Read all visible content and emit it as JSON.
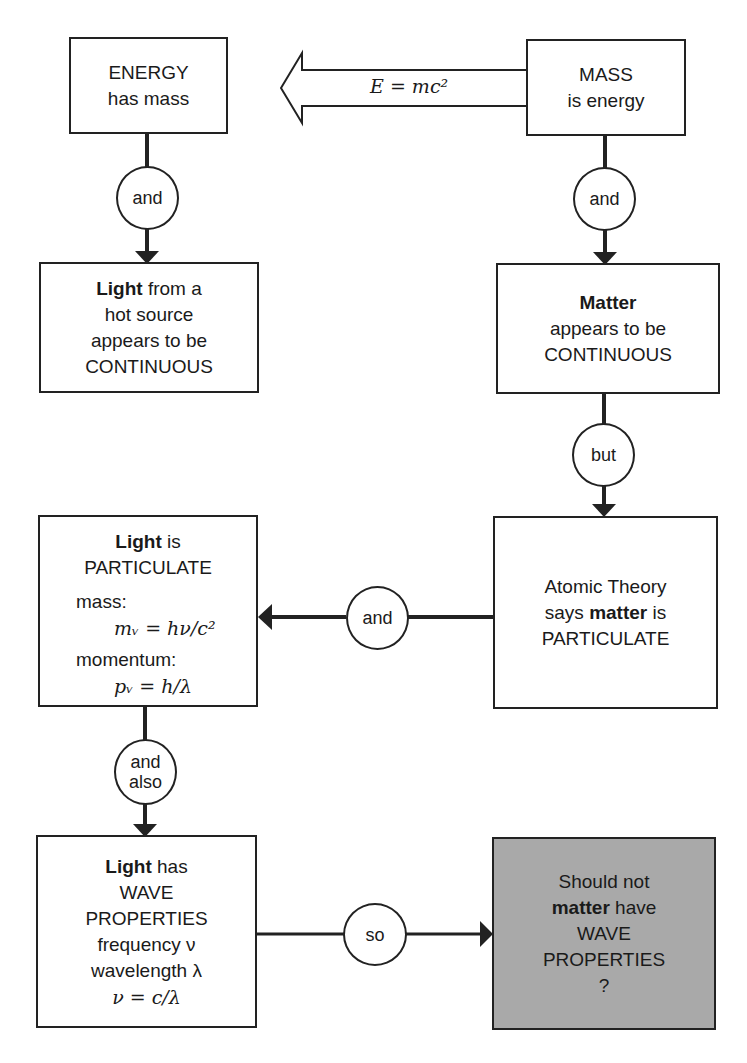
{
  "diagram": {
    "equivalence": {
      "label": "E = mc²"
    },
    "boxes": {
      "energy": {
        "line1": "ENERGY",
        "line2": "has mass"
      },
      "mass": {
        "line1": "MASS",
        "line2": "is energy"
      },
      "light_continuous": {
        "bold": "Light",
        "rest": " from a",
        "line2": "hot source",
        "line3": "appears to be",
        "line4": "CONTINUOUS"
      },
      "matter_continuous": {
        "bold": "Matter",
        "line2": "appears to be",
        "line3": "CONTINUOUS"
      },
      "light_particulate": {
        "bold": "Light",
        "rest": " is",
        "line2": "PARTICULATE",
        "mass_label": "mass:",
        "mass_eq": "mᵥ = hν/c²",
        "momentum_label": "momentum:",
        "momentum_eq": "pᵥ = h/λ"
      },
      "atomic_theory": {
        "line1": "Atomic Theory",
        "pre": "says ",
        "bold": "matter",
        "post": " is",
        "line3": "PARTICULATE"
      },
      "light_wave": {
        "bold": "Light",
        "rest": " has",
        "line2": "WAVE",
        "line3": "PROPERTIES",
        "line4": "frequency ν",
        "line5": "wavelength λ",
        "line6": "ν = c/λ"
      },
      "question": {
        "line1": "Should not",
        "bold": "matter",
        "rest": " have",
        "line3": "WAVE",
        "line4": "PROPERTIES",
        "line5": "?"
      }
    },
    "connectors": {
      "energy_to_light": "and",
      "mass_to_matter": "and",
      "matter_to_atomic": "but",
      "atomic_to_light": "and",
      "light_particulate_to_wave": {
        "line1": "and",
        "line2": "also"
      },
      "wave_to_question": "so"
    },
    "colors": {
      "line": "#222222",
      "shaded_box": "#a9a9a9",
      "background": "#ffffff"
    }
  }
}
